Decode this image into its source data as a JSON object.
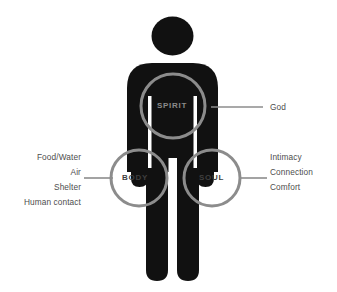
{
  "diagram": {
    "background_color": "#ffffff",
    "figure_color": "#111111",
    "ring_color": "#8c8c8c",
    "leader_color": "#8c8c8c",
    "label_color": "#4d4d4d",
    "rings": [
      {
        "id": "spirit",
        "label": "SPIRIT",
        "cx": 173,
        "cy": 106,
        "r": 32,
        "label_color": "#8a8a8a"
      },
      {
        "id": "body",
        "label": "BODY",
        "cx": 139,
        "cy": 178,
        "r": 28,
        "label_color": "#3f3f3f"
      },
      {
        "id": "soul",
        "label": "SOUL",
        "cx": 212,
        "cy": 178,
        "r": 28,
        "label_color": "#3f3f3f"
      }
    ],
    "callouts": {
      "spirit": {
        "items": [
          "God"
        ],
        "text": "God",
        "line": {
          "x1": 211,
          "y1": 107,
          "x2": 263,
          "y2": 107
        }
      },
      "body": {
        "items": [
          "Food/Water",
          "Air",
          "Shelter",
          "Human contact"
        ],
        "text": "Food/Water\nAir\nShelter\nHuman contact",
        "line": {
          "x1": 84,
          "y1": 178,
          "x2": 112,
          "y2": 178
        }
      },
      "soul": {
        "items": [
          "Intimacy",
          "Connection",
          "Comfort"
        ],
        "text": "Intimacy\nConnection\nComfort",
        "line": {
          "x1": 240,
          "y1": 178,
          "x2": 267,
          "y2": 178
        }
      }
    }
  }
}
